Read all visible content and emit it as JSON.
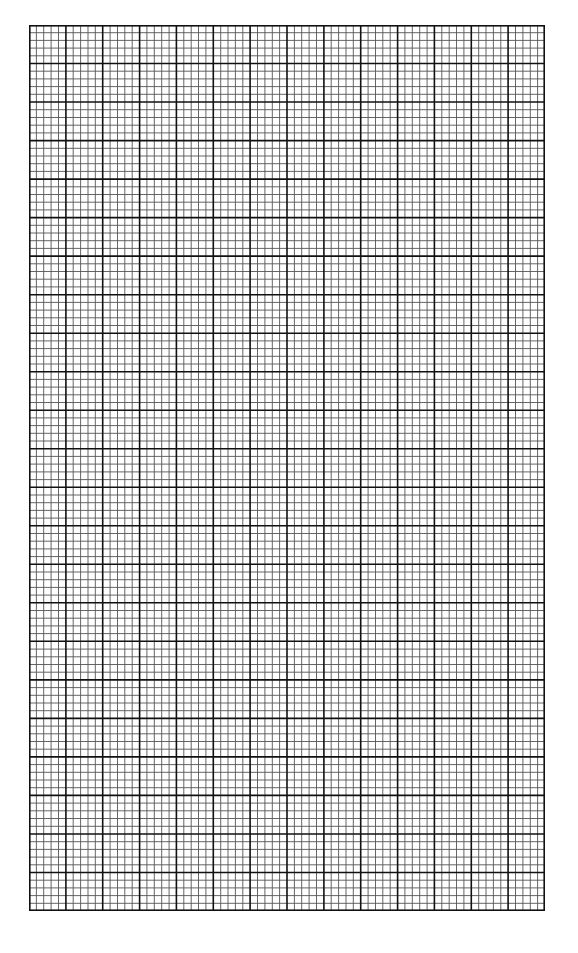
{
  "page": {
    "type": "graph-paper",
    "background_color": "#ffffff"
  },
  "grid": {
    "left": 29,
    "top": 25,
    "width": 516,
    "height": 886,
    "major_columns": 14,
    "major_rows": 23,
    "minor_per_major": 5,
    "major_line_color": "#111111",
    "minor_line_color": "#555555",
    "major_line_width": 1.6,
    "minor_line_width": 0.9,
    "border_color": "#111111"
  }
}
